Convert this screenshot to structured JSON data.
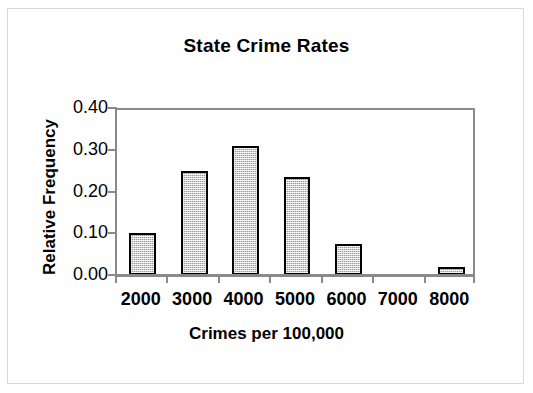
{
  "chart_data": {
    "type": "bar",
    "title": "State Crime Rates",
    "xlabel": "Crimes per 100,000",
    "ylabel": "Relative Frequency",
    "categories": [
      "2000",
      "3000",
      "4000",
      "5000",
      "6000",
      "7000",
      "8000"
    ],
    "values": [
      0.1,
      0.25,
      0.31,
      0.235,
      0.075,
      0.0,
      0.02
    ],
    "ylim": [
      0.0,
      0.4
    ],
    "ytick_labels": [
      "0.40",
      "0.30",
      "0.20",
      "0.10",
      "0.00"
    ],
    "ytick_values": [
      0.4,
      0.3,
      0.2,
      0.1,
      0.0
    ],
    "grid": false,
    "legend": "none",
    "bar_fill_color": "#9a9a9a",
    "bar_border_color": "#000000",
    "axis_color": "#8a8a8a",
    "background_color": "#ffffff"
  }
}
